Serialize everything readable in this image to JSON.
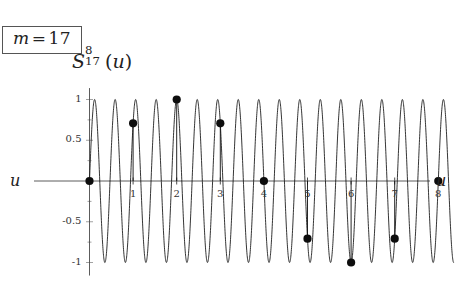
{
  "parameter_box": {
    "variable": "m",
    "equals": "=",
    "value": "17",
    "full_text": "m = 17"
  },
  "title": {
    "base": "S",
    "superscript": "8",
    "subscript": "17",
    "open_paren": "(",
    "argument": "u",
    "close_paren": ")",
    "full_text": "S_17^8(u)"
  },
  "axes": {
    "x_name_left": "u",
    "x_name_right": "u",
    "x_tick_labels": [
      "1",
      "2",
      "3",
      "4",
      "5",
      "6",
      "7",
      "8"
    ],
    "x_tick_values": [
      1,
      2,
      3,
      4,
      5,
      6,
      7,
      8
    ],
    "y_tick_labels": [
      "1",
      "0.5",
      "-0.5",
      "-1"
    ],
    "y_tick_values": [
      1,
      0.5,
      -0.5,
      -1
    ]
  },
  "colors": {
    "curve": "#111111",
    "axis": "#4a4a4a",
    "dot": "#0d0d0d",
    "box_border": "#555555",
    "background": "#ffffff"
  },
  "chart_data": {
    "type": "line",
    "xlabel": "u",
    "ylabel": "",
    "xlim": [
      -0.18,
      8.55
    ],
    "ylim": [
      -1.12,
      1.12
    ],
    "grid": false,
    "legend": null,
    "frequency_cycles_per_unit": 2.125,
    "series": [
      {
        "name": "S_17^8(u)",
        "formula": "sin(17*pi*u/8)",
        "style": "continuous-curve",
        "x_range": [
          0,
          8.35
        ],
        "samples": 2600
      }
    ],
    "sample_points": {
      "name": "integer samples",
      "x": [
        0,
        1,
        2,
        3,
        4,
        5,
        6,
        7,
        8
      ],
      "y": [
        0,
        0.7071,
        1.0,
        0.7071,
        0.0,
        -0.7071,
        -1.0,
        -0.7071,
        0.0
      ],
      "marker": "filled-circle"
    }
  }
}
